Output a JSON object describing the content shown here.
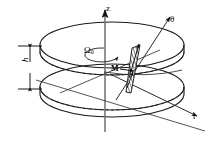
{
  "figure": {
    "background": "#ffffff",
    "stroke": "#1a1a1a",
    "width": 215,
    "height": 142
  },
  "labels": {
    "z_axis": "z",
    "theta_axis": "θ",
    "r_axis": "r",
    "omega": "Ω",
    "omega_sub": "0",
    "magnetization": "M",
    "height": "h"
  },
  "axes": [
    {
      "name": "z",
      "label": "z",
      "direction": "vertical-up"
    },
    {
      "name": "theta",
      "label": "θ",
      "direction": "upper-right"
    },
    {
      "name": "r",
      "label": "r",
      "direction": "lower-right"
    }
  ],
  "annotations": [
    {
      "name": "rotation",
      "label": "Ω₀",
      "description": "angular velocity of disk about z axis"
    },
    {
      "name": "magnetization",
      "label": "M",
      "description": "magnetization vector at element"
    },
    {
      "name": "thickness",
      "label": "h",
      "description": "disk thickness dimension"
    }
  ],
  "geometry": {
    "top_disk": {
      "cx": 112,
      "cy": 45,
      "rx": 72,
      "ry": 23
    },
    "bottom_disk": {
      "cx": 112,
      "cy": 87,
      "rx": 72,
      "ry": 23
    },
    "inner_top": {
      "cx": 112,
      "cy": 52,
      "rx": 56,
      "ry": 14
    },
    "inner_bottom": {
      "cx": 112,
      "cy": 78,
      "rx": 56,
      "ry": 14
    },
    "rotation_loop": {
      "cx": 112,
      "cy": 52,
      "rx": 18,
      "ry": 7
    }
  }
}
